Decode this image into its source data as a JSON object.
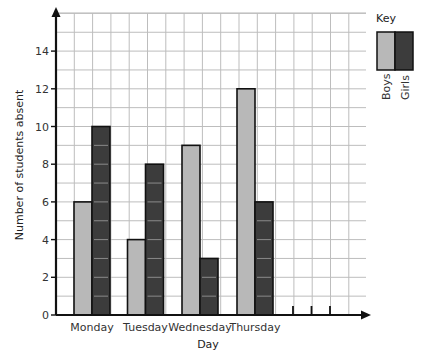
{
  "chart_data": {
    "type": "bar",
    "title": "",
    "xlabel": "Day",
    "ylabel": "Number of students absent",
    "categories": [
      "Monday",
      "Tuesday",
      "Wednesday",
      "Thursday"
    ],
    "series": [
      {
        "name": "Boys",
        "values": [
          6,
          4,
          9,
          12
        ],
        "color": "#b8b8b8"
      },
      {
        "name": "Girls",
        "values": [
          10,
          8,
          3,
          6
        ],
        "color": "#3c3c3c"
      }
    ],
    "yticks": [
      0,
      2,
      4,
      6,
      8,
      10,
      12,
      14
    ],
    "ylim": [
      0,
      15.4
    ],
    "grid": true,
    "legend": {
      "title": "Key",
      "position": "right",
      "entries": [
        "Boys",
        "Girls"
      ]
    },
    "extra_empty_ticks": 3
  },
  "colors": {
    "boys": "#b8b8b8",
    "girls": "#3c3c3c",
    "grid": "#bdbdbd",
    "axis": "#111111"
  }
}
